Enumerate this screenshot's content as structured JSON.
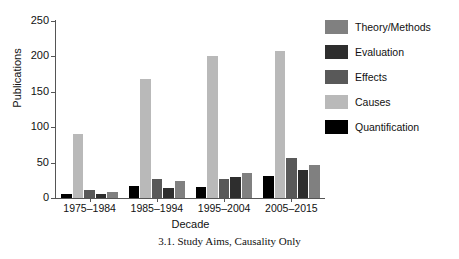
{
  "chart_data": {
    "type": "bar",
    "title": "",
    "caption": "3.1.  Study Aims, Causality Only",
    "xlabel": "Decade",
    "ylabel": "Publications",
    "ylim": [
      0,
      250
    ],
    "yticks": [
      0,
      50,
      100,
      150,
      200,
      250
    ],
    "grid": false,
    "legend_position": "right",
    "categories": [
      "1975–1984",
      "1985–1994",
      "1995–2004",
      "2005–2015"
    ],
    "series": [
      {
        "name": "Quantification",
        "color": "#000000",
        "values": [
          6,
          17,
          16,
          31
        ]
      },
      {
        "name": "Causes",
        "color": "#b9b9b9",
        "values": [
          91,
          168,
          200,
          208
        ]
      },
      {
        "name": "Effects",
        "color": "#595959",
        "values": [
          12,
          27,
          27,
          57
        ]
      },
      {
        "name": "Evaluation",
        "color": "#2e2e2e",
        "values": [
          6,
          14,
          30,
          39
        ]
      },
      {
        "name": "Theory/Methods",
        "color": "#808080",
        "values": [
          8,
          24,
          36,
          47
        ]
      }
    ],
    "bar_order_in_group": [
      "Quantification",
      "Causes",
      "Effects",
      "Evaluation",
      "Theory/Methods"
    ],
    "legend_order": [
      "Theory/Methods",
      "Evaluation",
      "Effects",
      "Causes",
      "Quantification"
    ]
  },
  "legend": {
    "items": [
      {
        "label": "Theory/Methods",
        "color": "#808080"
      },
      {
        "label": "Evaluation",
        "color": "#2e2e2e"
      },
      {
        "label": "Effects",
        "color": "#595959"
      },
      {
        "label": "Causes",
        "color": "#b9b9b9"
      },
      {
        "label": "Quantification",
        "color": "#000000"
      }
    ]
  }
}
